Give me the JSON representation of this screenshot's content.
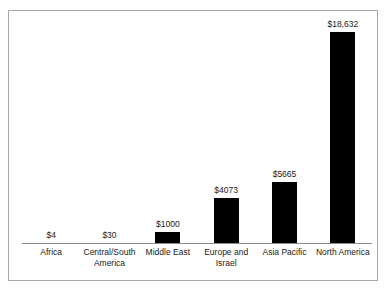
{
  "chart_data": {
    "type": "bar",
    "title": "",
    "subtitle": "",
    "xlabel": "",
    "ylabel": "",
    "grid": false,
    "legend": false,
    "axis": {
      "y_visible": false,
      "y_ticks": [],
      "x_axis_line": true,
      "ylim": [
        0,
        20500
      ]
    },
    "categories": [
      "Africa",
      "Central/South America",
      "Middle East",
      "Europe and Israel",
      "Asia Pacific",
      "North America"
    ],
    "values": [
      4,
      30,
      1000,
      4073,
      5665,
      18632
    ],
    "data_labels": [
      "$4",
      "$30",
      "$1000",
      "$4073",
      "$5665",
      "$18,632"
    ],
    "series": [
      {
        "name": "",
        "values": [
          4,
          30,
          1000,
          4073,
          5665,
          18632
        ]
      }
    ],
    "bar_color": "#000000",
    "axis_color": "#8c8c8c",
    "frame_color": "#a8a8a8",
    "text_color": "#1a1a1a"
  },
  "bars": [
    {
      "category": "Africa",
      "label_lines": [
        "Africa"
      ],
      "value": 4,
      "value_label": "$4",
      "bar_height_px": 0
    },
    {
      "category": "Central/South America",
      "label_lines": [
        "Central/South",
        "America"
      ],
      "value": 30,
      "value_label": "$30",
      "bar_height_px": 0
    },
    {
      "category": "Middle East",
      "label_lines": [
        "Middle East"
      ],
      "value": 1000,
      "value_label": "$1000",
      "bar_height_px": 11
    },
    {
      "category": "Europe and Israel",
      "label_lines": [
        "Europe and",
        "Israel"
      ],
      "value": 4073,
      "value_label": "$4073",
      "bar_height_px": 45
    },
    {
      "category": "Asia Pacific",
      "label_lines": [
        "Asia Pacific"
      ],
      "value": 5665,
      "value_label": "$5665",
      "bar_height_px": 61
    },
    {
      "category": "North America",
      "label_lines": [
        "North America"
      ],
      "value": 18632,
      "value_label": "$18,632",
      "bar_height_px": 211
    }
  ]
}
